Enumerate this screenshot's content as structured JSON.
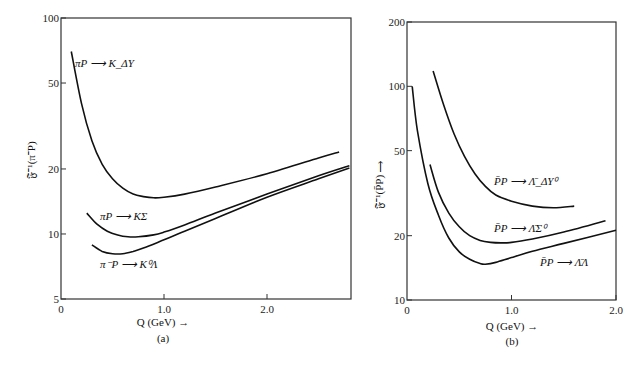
{
  "chart_data": [
    {
      "type": "line",
      "panel": "(a)",
      "title": "",
      "xlabel": "Q (GeV) →",
      "ylabel": "𝔉⁻¹(π⁻P)",
      "xlim": [
        0,
        2.8
      ],
      "ylim": [
        5,
        100
      ],
      "yscale": "log",
      "x_ticks": [
        "0",
        "1.0",
        "2.0"
      ],
      "y_ticks": [
        "100",
        "50",
        "20",
        "10",
        "5"
      ],
      "grid": false,
      "series": [
        {
          "name": "πP → K_ΔY",
          "x": [
            0.1,
            0.2,
            0.3,
            0.4,
            0.5,
            0.6,
            0.7,
            0.8,
            0.9,
            1.0,
            1.2,
            1.5,
            2.0,
            2.5,
            2.7
          ],
          "values": [
            70,
            40,
            27,
            21,
            18,
            16.3,
            15.3,
            14.9,
            14.7,
            14.8,
            15.3,
            16.5,
            19,
            22.5,
            24
          ]
        },
        {
          "name": "πP → KΣ",
          "x": [
            0.25,
            0.35,
            0.45,
            0.55,
            0.65,
            0.75,
            0.9,
            1.0,
            1.2,
            1.5,
            2.0,
            2.5,
            2.8
          ],
          "values": [
            12.5,
            11.1,
            10.3,
            9.9,
            9.7,
            9.7,
            9.9,
            10.2,
            11.0,
            12.5,
            15.3,
            18.6,
            20.7
          ]
        },
        {
          "name": "π⁻P → K⁰Λ",
          "x": [
            0.3,
            0.4,
            0.5,
            0.6,
            0.7,
            0.8,
            1.0,
            1.2,
            1.5,
            2.0,
            2.5,
            2.8
          ],
          "values": [
            8.9,
            8.3,
            8.1,
            8.1,
            8.3,
            8.6,
            9.4,
            10.3,
            11.8,
            14.8,
            18.0,
            20.2
          ]
        }
      ]
    },
    {
      "type": "line",
      "panel": "(b)",
      "title": "",
      "xlabel": "Q (GeV) →",
      "ylabel": "𝔉⁻¹(P̄P) →",
      "xlim": [
        0,
        2.0
      ],
      "ylim": [
        10,
        200
      ],
      "yscale": "log",
      "x_ticks": [
        "0",
        "1.0",
        "2.0"
      ],
      "y_ticks": [
        "200",
        "100",
        "50",
        "20",
        "10"
      ],
      "grid": false,
      "series": [
        {
          "name": "P̄P → Λ̄_ΔY⁰",
          "x": [
            0.25,
            0.35,
            0.45,
            0.55,
            0.65,
            0.75,
            0.85,
            1.0,
            1.2,
            1.4,
            1.6
          ],
          "values": [
            118,
            82,
            60,
            47,
            39,
            34,
            31,
            29,
            27.5,
            27,
            27.5
          ]
        },
        {
          "name": "P̄P → Λ̄Σ⁰",
          "x": [
            0.22,
            0.3,
            0.4,
            0.5,
            0.6,
            0.7,
            0.8,
            0.9,
            1.0,
            1.2,
            1.5,
            1.9
          ],
          "values": [
            43,
            32,
            25.5,
            22,
            20,
            19,
            18.6,
            18.5,
            18.6,
            19.3,
            20.8,
            23.5
          ]
        },
        {
          "name": "P̄P → Λ̄Λ",
          "x": [
            0.05,
            0.1,
            0.2,
            0.3,
            0.4,
            0.5,
            0.6,
            0.7,
            0.75,
            0.85,
            1.0,
            1.2,
            1.5,
            2.0
          ],
          "values": [
            100,
            62,
            35,
            25,
            19.5,
            16.8,
            15.5,
            14.8,
            14.7,
            15.0,
            15.8,
            16.9,
            18.4,
            21.2
          ]
        }
      ]
    }
  ],
  "panels": {
    "a": {
      "label": "(a)",
      "xlabel": "Q (GeV) →",
      "ylabel": "𝔉⁻¹(π⁻P)",
      "x_ticks": [
        "0",
        "1.0",
        "2.0"
      ],
      "y_ticks": [
        "100",
        "50",
        "20",
        "10",
        "5"
      ],
      "series_labels": [
        "πP ⟶ K_ΔY",
        "πP ⟶ KΣ",
        "π⁻P ⟶ K⁰Λ"
      ]
    },
    "b": {
      "label": "(b)",
      "xlabel": "Q (GeV) →",
      "ylabel": "𝔉⁻¹(P̄P) ⟶",
      "x_ticks": [
        "0",
        "1.0",
        "2.0"
      ],
      "y_ticks": [
        "200",
        "100",
        "50",
        "20",
        "10"
      ],
      "series_labels": [
        "P̄P ⟶ Λ̄_ΔY⁰",
        "P̄P ⟶ Λ̄Σ⁰",
        "P̄P ⟶ Λ̄Λ"
      ]
    }
  }
}
